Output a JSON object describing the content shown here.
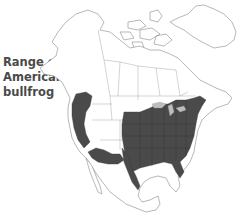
{
  "map": {
    "title": "Range of\nAmerican\nbullfrog",
    "subject": "American bullfrog",
    "region": "North America",
    "colors": {
      "range_fill": "#4a4a4a",
      "land_fill": "#ffffff",
      "borders": "#9a9a9a",
      "lakes": "#bdbdbd",
      "text": "#4a4a4a"
    },
    "legend": {
      "range_label": "Range of American bullfrog"
    }
  }
}
